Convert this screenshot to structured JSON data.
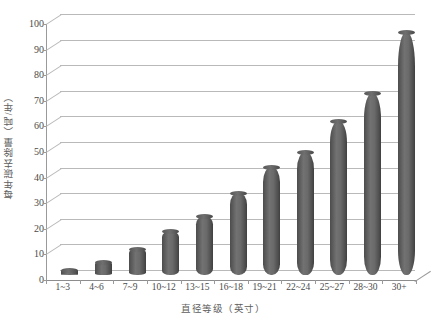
{
  "chart_data": {
    "type": "bar",
    "title": "",
    "subtitle": "",
    "xlabel": "直径等级（英寸）",
    "ylabel": "每年碳去除量（吨/年）",
    "categories": [
      "1~3",
      "4~6",
      "7~9",
      "10~12",
      "13~15",
      "16~18",
      "19~21",
      "22~24",
      "25~27",
      "28~30",
      "30+"
    ],
    "values": [
      2,
      5,
      10,
      17,
      23,
      32,
      42,
      48,
      60,
      71,
      95
    ],
    "ylim": [
      0,
      100
    ],
    "ytick_labels": [
      "0",
      "10",
      "20",
      "30",
      "40",
      "50",
      "60",
      "70",
      "80",
      "90",
      "100"
    ],
    "ytick_values": [
      0,
      10,
      20,
      30,
      40,
      50,
      60,
      70,
      80,
      90,
      100
    ],
    "ystep": 10,
    "grid": true,
    "legend": false,
    "legend_position": "none",
    "series_name": "每年碳去除量",
    "style": "3d-cylinder",
    "colors": {
      "bar": "#5f5f5f",
      "bar_dark_edge": "#3f3f3f",
      "bar_highlight": "#727272",
      "gridline": "#b9b9b9",
      "axis": "#9a9a9a",
      "tick_text": "#4a4a4a",
      "title_text": "#5d5d5d",
      "background": "#ffffff"
    }
  },
  "axis": {
    "y_title": "每年碳去除量（吨/年）",
    "x_title": "直径等级（英寸）"
  }
}
